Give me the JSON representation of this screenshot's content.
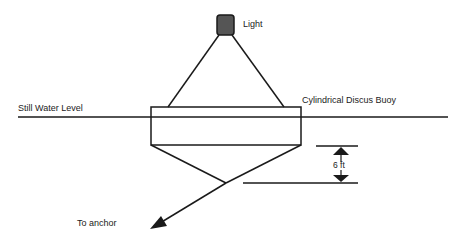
{
  "diagram": {
    "labels": {
      "light": "Light",
      "buoy": "Cylindrical Discus Buoy",
      "water_level": "Still Water Level",
      "dimension": "6 ft",
      "anchor": "To anchor"
    },
    "colors": {
      "line": "#1a1a1a",
      "light_fill": "#555555",
      "text": "#222222"
    }
  }
}
